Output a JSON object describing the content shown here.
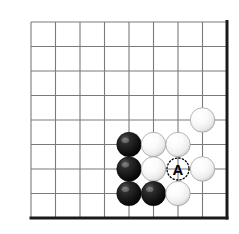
{
  "figure": {
    "board": {
      "type": "go-goban",
      "grid_cols": 9,
      "grid_rows": 9,
      "line_color": "#7a7a7a",
      "edge_color": "#1a1a1a",
      "background_color": "#ffffff",
      "origin_x": 31,
      "origin_y": 22,
      "spacing": 24.5,
      "edge_sides": [
        "right",
        "bottom"
      ]
    },
    "stones": [
      {
        "id": "w1",
        "color": "white",
        "col": 7,
        "row": 4,
        "label": ""
      },
      {
        "id": "b1",
        "color": "black",
        "col": 4,
        "row": 5,
        "label": ""
      },
      {
        "id": "w2",
        "color": "white",
        "col": 5,
        "row": 5,
        "label": ""
      },
      {
        "id": "w3",
        "color": "white",
        "col": 6,
        "row": 5,
        "label": ""
      },
      {
        "id": "b2",
        "color": "black",
        "col": 4,
        "row": 6,
        "label": ""
      },
      {
        "id": "w4",
        "color": "white",
        "col": 5,
        "row": 6,
        "label": ""
      },
      {
        "id": "w5",
        "color": "white",
        "col": 7,
        "row": 6,
        "label": ""
      },
      {
        "id": "b3",
        "color": "black",
        "col": 4,
        "row": 7,
        "label": ""
      },
      {
        "id": "b4",
        "color": "black",
        "col": 5,
        "row": 7,
        "label": ""
      },
      {
        "id": "w6",
        "color": "white",
        "col": 6,
        "row": 7,
        "label": ""
      }
    ],
    "markers": [
      {
        "id": "m-a",
        "label": "A",
        "col": 6,
        "row": 6,
        "style": "dotted-circle",
        "text_color": "#000000",
        "ring_color": "#000000"
      }
    ],
    "colors": {
      "black_stone": "#111111",
      "white_stone": "#fdfdfd",
      "white_stone_edge": "#9a9a9a",
      "grid": "#7a7a7a",
      "border": "#1a1a1a",
      "marker": "#000000"
    }
  }
}
